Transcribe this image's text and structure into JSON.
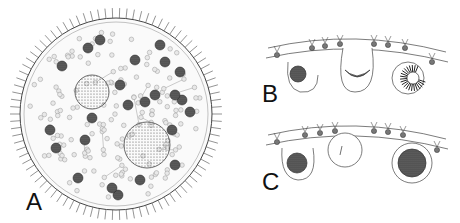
{
  "figure": {
    "panels": [
      {
        "id": "A",
        "label": "A",
        "description": "whole spherical colony with cilia, somatic cells, daughter colonies"
      },
      {
        "id": "B",
        "label": "B",
        "description": "section of colony wall showing germ cell development stages with inversion"
      },
      {
        "id": "C",
        "label": "C",
        "description": "section of colony wall showing germ cells and zygote"
      }
    ],
    "colors": {
      "ink": "#333333",
      "stipple": "#777777",
      "background": "#ffffff"
    }
  }
}
